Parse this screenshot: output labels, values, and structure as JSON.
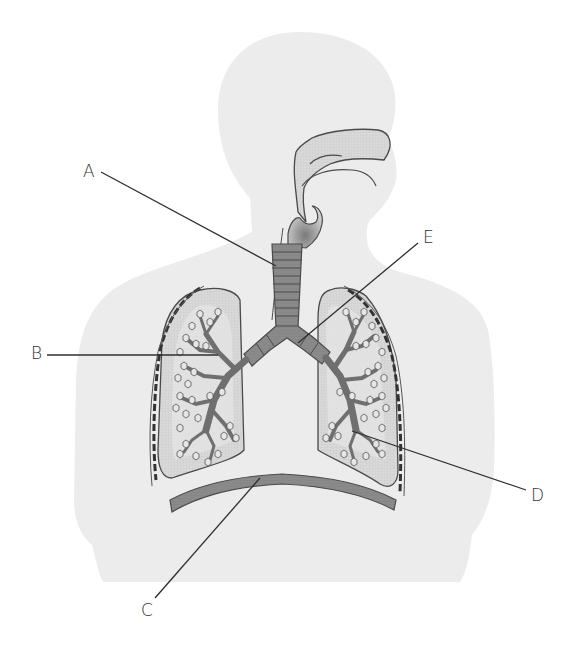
{
  "diagram": {
    "colors": {
      "body": "#ececec",
      "lung": "#d6d6d6",
      "lung_inner": "#e3e3e3",
      "airway": "#8a8a8a",
      "airway_dark": "#6f6f6f",
      "outline": "#4a4a4a",
      "nasal": "#dcdcdc",
      "leader_line": "#2f2f2f",
      "label_text": "#333333"
    },
    "labels": [
      {
        "id": "A",
        "text": "A",
        "x": 83,
        "y": 163,
        "target": "trachea"
      },
      {
        "id": "B",
        "text": "B",
        "x": 31,
        "y": 345,
        "target": "bronchiole (left lung)"
      },
      {
        "id": "C",
        "text": "C",
        "x": 141,
        "y": 602,
        "target": "diaphragm"
      },
      {
        "id": "D",
        "text": "D",
        "x": 531,
        "y": 487,
        "target": "alveoli (right lung)"
      },
      {
        "id": "E",
        "text": "E",
        "x": 423,
        "y": 229,
        "target": "bronchus"
      }
    ],
    "leader_lines": [
      {
        "id": "A",
        "x1": 101,
        "y1": 172,
        "x2": 276,
        "y2": 266
      },
      {
        "id": "B",
        "x1": 47,
        "y1": 355,
        "x2": 218,
        "y2": 355
      },
      {
        "id": "C",
        "x1": 155,
        "y1": 598,
        "x2": 260,
        "y2": 478
      },
      {
        "id": "D",
        "x1": 526,
        "y1": 490,
        "x2": 352,
        "y2": 431
      },
      {
        "id": "E",
        "x1": 418,
        "y1": 243,
        "x2": 298,
        "y2": 343
      }
    ]
  }
}
